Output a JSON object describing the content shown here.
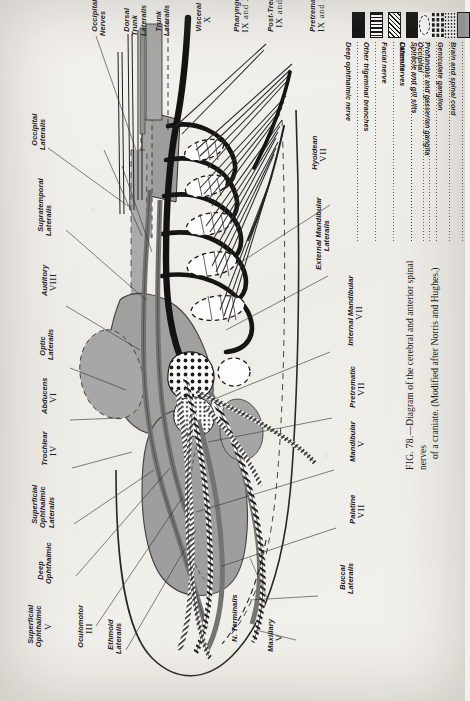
{
  "figure": {
    "number": "FIG. 78.",
    "caption_line1": "—Diagram of the cerebral and anterior spinal nerves",
    "caption_line2": "of a craniate.  (Modified after Norris and Hughes.)"
  },
  "legend": {
    "entries": [
      {
        "label": "Deep ophthalmic nerve",
        "swatch": "solid-black-bar",
        "swatch_class": "sw-ladder"
      },
      {
        "label": "Other trigeminal branches",
        "swatch": "fine-ladder-bar",
        "swatch_class": "sw-ladder2"
      },
      {
        "label": "Facial nerve",
        "swatch": "cross-hatched-bar",
        "swatch_class": "sw-hatch"
      },
      {
        "label": "Lateralis",
        "swatch": "solid-gray-bar",
        "swatch_class": "sw-gray"
      },
      {
        "label": "Occipital",
        "swatch": "double-line-bar",
        "swatch_class": "sw-double"
      },
      {
        "label": "Other nerves",
        "swatch": "solid-black-block",
        "swatch_class": "sw-blk"
      },
      {
        "label": "Spiracle and gill slits",
        "swatch": "dashed-ellipse",
        "swatch_class": "sw-ellipse"
      },
      {
        "label": "Profundus and gasserian ganglia",
        "swatch": "coarse-dots",
        "swatch_class": "sw-bigdot"
      },
      {
        "label": "Geniculate ganglion",
        "swatch": "fine-dots",
        "swatch_class": "sw-smalldot"
      },
      {
        "label": "Brain and spinal cord",
        "swatch": "gray-block-outlined",
        "swatch_class": "sw-grayb"
      }
    ]
  },
  "labels": [
    {
      "id": "occipital-lateralis",
      "name": "Occipital",
      "sub": "Lateralis",
      "roman": ""
    },
    {
      "id": "occipital-nerves",
      "name": "Occipital",
      "sub": "Nerves",
      "roman": ""
    },
    {
      "id": "dorsal-trunk-lateralis",
      "name": "Dorsal",
      "sub": "Trunk\nLateralis",
      "roman": ""
    },
    {
      "id": "trunk-lateralis",
      "name": "Trunk",
      "sub": "Lateralis",
      "roman": ""
    },
    {
      "id": "visceral-x",
      "name": "Visceral",
      "sub": "",
      "roman": "X"
    },
    {
      "id": "pharyngeal-ix-x",
      "name": "Pharyngeal",
      "sub": "",
      "roman": "IX and X"
    },
    {
      "id": "post-trematic-ix-x",
      "name": "Post-Trematic",
      "sub": "",
      "roman": "IX and X"
    },
    {
      "id": "pretrematic-ix-x",
      "name": "Pretrematic",
      "sub": "",
      "roman": "IX and X"
    },
    {
      "id": "hyoidean-vii",
      "name": "Hyoidean",
      "sub": "",
      "roman": "VII"
    },
    {
      "id": "supratemporal-lateralis",
      "name": "Supratemporal",
      "sub": "Lateralis",
      "roman": ""
    },
    {
      "id": "auditory-viii",
      "name": "Auditory",
      "sub": "",
      "roman": "VIII"
    },
    {
      "id": "optic-lateralis",
      "name": "Optic",
      "sub": "Lateralis",
      "roman": ""
    },
    {
      "id": "abducens-vi",
      "name": "Abducens",
      "sub": "",
      "roman": "VI"
    },
    {
      "id": "trochlear-iv",
      "name": "Trochlear",
      "sub": "",
      "roman": "IV"
    },
    {
      "id": "superficial-ophthalmic-lateralis",
      "name": "Superficial",
      "sub": "Ophthalmic\nLateralis",
      "roman": ""
    },
    {
      "id": "deep-ophthalmic",
      "name": "Deep",
      "sub": "Ophthalmic",
      "roman": ""
    },
    {
      "id": "superficial-ophthalmic-v",
      "name": "Superficial",
      "sub": "Ophthalmic",
      "roman": "V"
    },
    {
      "id": "oculomotor-iii",
      "name": "Oculomotor",
      "sub": "",
      "roman": "III"
    },
    {
      "id": "ethmoid-lateralis",
      "name": "Ethmoid",
      "sub": "Lateralis",
      "roman": ""
    },
    {
      "id": "n-terminalis",
      "name": "N. Terminalis",
      "sub": "",
      "roman": ""
    },
    {
      "id": "maxillary-v",
      "name": "Maxillary",
      "sub": "",
      "roman": "V"
    },
    {
      "id": "buccal-lateralis",
      "name": "Buccal",
      "sub": "Lateralis",
      "roman": ""
    },
    {
      "id": "palatine-vii",
      "name": "Palatine",
      "sub": "",
      "roman": "VII"
    },
    {
      "id": "mandibular-v",
      "name": "Mandibular",
      "sub": "",
      "roman": "V"
    },
    {
      "id": "pretrematic-vii",
      "name": "Pretrematic",
      "sub": "",
      "roman": "VII"
    },
    {
      "id": "internal-mandibular-vii",
      "name": "Internal Mandibular",
      "sub": "",
      "roman": "VII"
    },
    {
      "id": "external-mandibular-lateralis",
      "name": "External Mandibular",
      "sub": "Lateralis",
      "roman": ""
    }
  ],
  "colors": {
    "paper": "#f2f0ec",
    "ink": "#1b1b1b",
    "gray_fill": "#8b8b8b",
    "light_gray": "#b4b4b4"
  }
}
